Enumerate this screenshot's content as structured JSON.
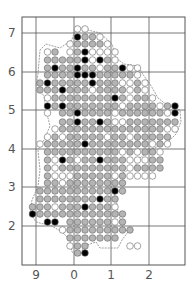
{
  "map": {
    "y_ticks": [
      {
        "label": "7",
        "y": 33
      },
      {
        "label": "6",
        "y": 72
      },
      {
        "label": "5",
        "y": 110
      },
      {
        "label": "4",
        "y": 149
      },
      {
        "label": "3",
        "y": 187
      },
      {
        "label": "2",
        "y": 226
      }
    ],
    "x_ticks": [
      {
        "label": "9",
        "x": 36
      },
      {
        "label": "0",
        "x": 74
      },
      {
        "label": "1",
        "x": 111
      },
      {
        "label": "2",
        "x": 149
      }
    ],
    "frame": {
      "left": 22,
      "top": 17,
      "right": 185,
      "bottom": 265
    },
    "colors": {
      "open": "#ffffff",
      "grey": "#b4b4b4",
      "solid": "#000000",
      "grid": "#555555",
      "outline": "#888888"
    },
    "legend_meaning": {
      "W": "open circle",
      "G": "grey circle",
      "B": "solid circle"
    },
    "dot_origin_x": 40,
    "dot_pitch": 7.5,
    "rows": [
      {
        "y": 29,
        "start": 5,
        "dots": "WW"
      },
      {
        "y": 37,
        "start": 5,
        "dots": "BGGW"
      },
      {
        "y": 44,
        "start": 4,
        "dots": "WGGGGW"
      },
      {
        "y": 52,
        "start": 1,
        "dots": "WG WGBWWWW"
      },
      {
        "y": 60,
        "start": 1,
        "dots": "GGGGGBWBGW"
      },
      {
        "y": 68,
        "start": 1,
        "dots": "GBGGBGGWGGBWW"
      },
      {
        "y": 75,
        "start": 1,
        "dots": "GGGGBBBGGGGGW"
      },
      {
        "y": 83,
        "start": 0,
        "dots": "GBGGGGGBGGGWWGW"
      },
      {
        "y": 90,
        "start": 0,
        "dots": "GGGBGGGWGGGGWGW"
      },
      {
        "y": 98,
        "start": 1,
        "dots": "WGGGGGGGGBGWGGW"
      },
      {
        "y": 106,
        "start": 1,
        "dots": "BGBGGGGGGGWGGGGWGB"
      },
      {
        "y": 113,
        "start": 1,
        "dots": "W GGBGGGGWGGGGGGWB"
      },
      {
        "y": 122,
        "start": 3,
        "dots": "GGBGGBGWWGGGGGGG"
      },
      {
        "y": 129,
        "start": 2,
        "dots": "WGGGGGGGGGGGGGGWW"
      },
      {
        "y": 137,
        "start": 1,
        "dots": "WGWGGGGGWGGWGGGGG"
      },
      {
        "y": 144,
        "start": 0,
        "dots": "WGGGGGBGGGGGGGGWGW"
      },
      {
        "y": 152,
        "start": 1,
        "dots": "GGGGGGGGGGWGWGGW"
      },
      {
        "y": 160,
        "start": 1,
        "dots": "GWBGWGGBGGGWWWGG"
      },
      {
        "y": 168,
        "start": 1,
        "dots": "GWGGGGGGGGGWGGGG"
      },
      {
        "y": 176,
        "start": 1,
        "dots": "GWWWGGGGGWGWWWW"
      },
      {
        "y": 183,
        "start": 1,
        "dots": "GGWGGGGGGGG"
      },
      {
        "y": 191,
        "start": 0,
        "dots": "GGGGGGGGGGBG"
      },
      {
        "y": 199,
        "start": 0,
        "dots": "GGGGGGGGBGG"
      },
      {
        "y": 207,
        "start": -1,
        "dots": "GGGWGGGBGGGW"
      },
      {
        "y": 214,
        "start": -1,
        "dots": "BGGGGGGGGGGGG"
      },
      {
        "y": 222,
        "start": 1,
        "dots": "BB GGGGGGWG"
      },
      {
        "y": 230,
        "start": 3,
        "dots": "WGGGGGGGGG"
      },
      {
        "y": 238,
        "start": 4,
        "dots": "GGGGGGG"
      },
      {
        "y": 246,
        "start": 4,
        "dots": "WGG     WW"
      },
      {
        "y": 253,
        "start": 5,
        "dots": "GB"
      }
    ]
  }
}
